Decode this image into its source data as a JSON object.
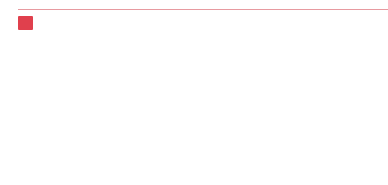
{
  "question": {
    "number": "13",
    "colors": {
      "accent": "#e0404d",
      "rule": "#e79aa0",
      "stroke": "#333333"
    }
  },
  "stem": {
    "cells": [
      "z-shape",
      "diagonal-with-bottom",
      "n-diagonal-left",
      "reverse-n"
    ],
    "connectors": [
      "circle-with-bars",
      "circle-with-cup",
      "circle-with-cup",
      "circle-with-cup"
    ],
    "extra": "diamond-with-r-hook"
  },
  "options": [
    {
      "label": "A",
      "cells": [
        "z-shape",
        "reverse-n",
        "diagonal-with-bottom",
        "empty"
      ]
    },
    {
      "label": "B",
      "cells": [
        "empty",
        "reverse-n",
        "n-diagonal-left",
        "z-shape"
      ]
    },
    {
      "label": "C",
      "cells": [
        "z-shape",
        "reverse-n",
        "n-diagonal-left",
        "empty"
      ]
    },
    {
      "label": "D",
      "cells": [
        "z-shape",
        "reverse-n",
        "empty",
        "n-diagonal-left"
      ]
    },
    {
      "label": "E",
      "cells": [
        "z-shape",
        "reverse-n",
        "n-diagonal-left",
        "diagonal-with-bottom"
      ]
    }
  ]
}
